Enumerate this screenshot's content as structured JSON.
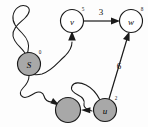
{
  "figure": {
    "type": "directed-graph",
    "title": "",
    "background_color": "#fdfdfd",
    "width": 148,
    "height": 127
  },
  "nodes": [
    {
      "id": "v",
      "label": "v",
      "superscript": "5",
      "fill": "white",
      "fill_color": "#ffffff",
      "cx": 72,
      "cy": 21,
      "r": 11.5
    },
    {
      "id": "w",
      "label": "w",
      "superscript": "8",
      "fill": "white",
      "fill_color": "#ffffff",
      "cx": 131,
      "cy": 21,
      "r": 11.5
    },
    {
      "id": "S",
      "label": "S",
      "superscript": "0",
      "fill": "gray",
      "fill_color": "#a8a8a8",
      "cx": 29,
      "cy": 64,
      "r": 11.5
    },
    {
      "id": "n1",
      "label": "",
      "superscript": "",
      "fill": "gray",
      "fill_color": "#a8a8a8",
      "cx": 68,
      "cy": 110,
      "r": 12.5
    },
    {
      "id": "u",
      "label": "u",
      "superscript": "2",
      "fill": "gray",
      "fill_color": "#a8a8a8",
      "cx": 105,
      "cy": 110,
      "r": 11.5
    }
  ],
  "edges": [
    {
      "from": "v",
      "to": "w",
      "weight": "3",
      "style": "straight",
      "weight_x": 101,
      "weight_y": 12
    },
    {
      "from": "u",
      "to": "w",
      "weight": "6",
      "style": "straight",
      "weight_x": 119,
      "weight_y": 66
    },
    {
      "from": "S",
      "to": "v",
      "weight": "",
      "style": "wiggly",
      "weight_x": 0,
      "weight_y": 0
    },
    {
      "from": "S",
      "to": "n1",
      "weight": "",
      "style": "wiggly",
      "weight_x": 0,
      "weight_y": 0
    },
    {
      "from": "u",
      "to": "n1",
      "weight": "",
      "style": "wiggly",
      "weight_x": 0,
      "weight_y": 0
    }
  ],
  "colors": {
    "node_white": "#ffffff",
    "node_gray": "#a8a8a8",
    "stroke": "#1a1a1a",
    "text": "#111111"
  }
}
